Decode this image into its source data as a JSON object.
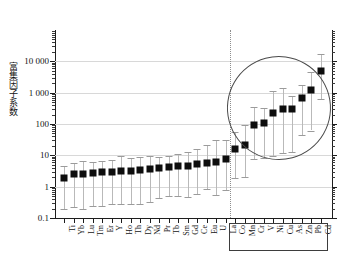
{
  "chart_data": {
    "type": "scatter",
    "title": "",
    "xlabel": "",
    "ylabel": "富集因子系数",
    "yscale": "log",
    "ylim": [
      0.1,
      100000
    ],
    "grid": true,
    "legend": null,
    "ytick_labels": [
      "10 000",
      "1 000",
      "100",
      "10",
      "1",
      "0.1"
    ],
    "ytick_values": [
      10000,
      1000,
      100,
      10,
      1,
      0.1
    ],
    "categories": [
      "Ti",
      "Yb",
      "Lu",
      "Tm",
      "Er",
      "Y",
      "Ho",
      "Th",
      "Dy",
      "Nd",
      "Pr",
      "Tb",
      "Sm",
      "Gd",
      "Ce",
      "Eu",
      "U",
      "La",
      "Co",
      "Mn",
      "Cr",
      "V",
      "Ni",
      "Cu",
      "As",
      "Zn",
      "Pb",
      "Cd"
    ],
    "series": [
      {
        "name": "富集因子系数",
        "values": [
          1.9,
          2.5,
          2.6,
          2.7,
          2.9,
          3.0,
          3.1,
          3.2,
          3.4,
          3.8,
          3.9,
          4.3,
          4.5,
          4.7,
          5.3,
          5.5,
          6.0,
          7.5,
          16,
          21,
          93,
          108,
          230,
          305,
          300,
          700,
          1230,
          4900
        ],
        "upper": [
          4.6,
          5.6,
          6.5,
          6.3,
          6.8,
          7.1,
          9.3,
          8.4,
          9.0,
          9.4,
          9.0,
          9.4,
          11.0,
          13.0,
          16.0,
          22.0,
          30.0,
          31.0,
          55.0,
          95.0,
          360.0,
          330.0,
          1100.0,
          1400.0,
          810.0,
          1750.0,
          4600.0,
          17000.0
        ],
        "lower": [
          0.2,
          0.23,
          0.19,
          0.24,
          0.25,
          0.27,
          0.28,
          0.29,
          0.29,
          0.32,
          0.44,
          0.51,
          0.52,
          0.46,
          0.6,
          0.85,
          0.54,
          0.76,
          1.85,
          2.1,
          7.8,
          8.2,
          9.5,
          12.0,
          12.5,
          44.0,
          62.0,
          620.0
        ]
      }
    ],
    "annotations": [
      {
        "name": "heavy-metal-ellipse",
        "kind": "ellipse",
        "covers": [
          "Co",
          "Mn",
          "Cr",
          "V",
          "Ni",
          "Cu",
          "As",
          "Zn",
          "Pb",
          "Cd"
        ]
      },
      {
        "name": "heavy-metal-label-box",
        "kind": "rectangle",
        "covers": [
          "Co",
          "Mn",
          "Cr",
          "V",
          "Ni",
          "Cu",
          "As",
          "Zn",
          "Pb",
          "Cd"
        ]
      },
      {
        "name": "group-divider",
        "kind": "vertical-dotted-line",
        "between": [
          "La",
          "Co"
        ]
      }
    ]
  }
}
